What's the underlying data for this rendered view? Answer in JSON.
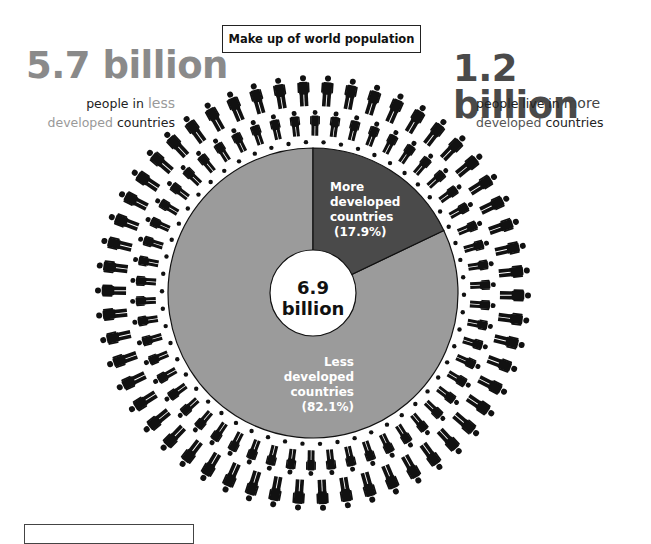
{
  "title": "Make up of world population",
  "left_stat": {
    "value": "5.7 billion",
    "line1_pre": "people in ",
    "line1_hl": "less",
    "line2_hl": "developed",
    "line2_post": " countries"
  },
  "right_stat": {
    "value": "1.2 billion",
    "line1_pre": "people live in ",
    "line1_hl": "more",
    "line2_hl": "developed",
    "line2_post": " countries"
  },
  "center": {
    "value": "6.9",
    "unit": "billion"
  },
  "slices": {
    "more": {
      "line1": "More",
      "line2": "developed",
      "line3": "countries",
      "pct": "(17.9%)"
    },
    "less": {
      "line1": "Less",
      "line2": "developed",
      "line3": "countries",
      "pct": "(82.1%)"
    }
  },
  "colors": {
    "more": "#4a4a4a",
    "less": "#9b9b9b",
    "figure": "#111111",
    "left_stat": "#8a8a8a",
    "right_stat": "#4a4a4a"
  },
  "chart_data": {
    "type": "pie",
    "title": "Make up of world population",
    "total_label": "6.9 billion",
    "categories": [
      "More developed countries",
      "Less developed countries"
    ],
    "values": [
      17.9,
      82.1
    ],
    "unit": "%",
    "absolute_values_billion": [
      1.2,
      5.7
    ],
    "start_angle_deg": 0,
    "direction": "clockwise",
    "donut_hole": true,
    "decoration": "radial rings of person icons surrounding the pie"
  }
}
